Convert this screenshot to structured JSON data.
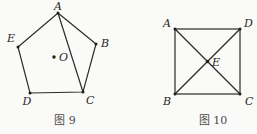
{
  "page": {
    "background": "#fafaf8"
  },
  "colors": {
    "line": "#2b2b2b",
    "dot": "#1e1e1e",
    "label": "#1f1f1f",
    "caption": "#4a4a4a"
  },
  "figure9": {
    "caption": "图 9",
    "labels": {
      "A": "A",
      "B": "B",
      "C": "C",
      "D": "D",
      "E": "E",
      "O": "O"
    }
  },
  "figure10": {
    "caption": "图 10",
    "labels": {
      "A": "A",
      "B": "B",
      "C": "C",
      "D": "D",
      "E": "E"
    }
  }
}
